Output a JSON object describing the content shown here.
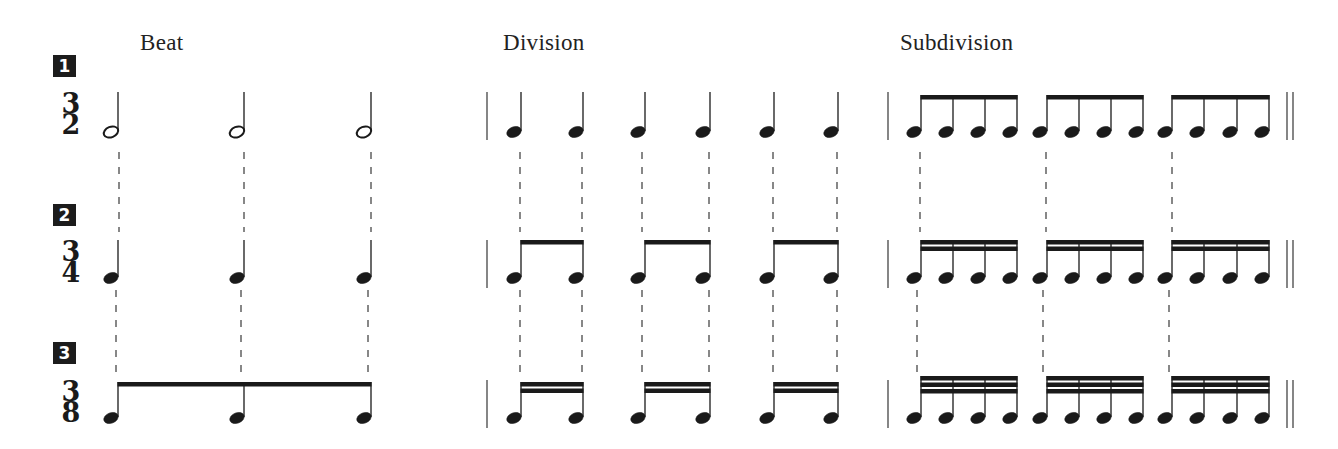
{
  "columns": [
    {
      "id": "beat",
      "title": "Beat",
      "x": 140
    },
    {
      "id": "division",
      "title": "Division",
      "x": 503
    },
    {
      "id": "subdivision",
      "title": "Subdivision",
      "x": 900
    }
  ],
  "rows": [
    {
      "number": "1",
      "time_signature": {
        "top": "3",
        "bottom": "2"
      },
      "badge_y": 54,
      "sig_y": 93,
      "beat": {
        "note": "half",
        "count": 3
      },
      "division": {
        "note": "quarter",
        "count": 6
      },
      "subdivision": {
        "note": "eighth",
        "groups": 3,
        "per_group": 4
      }
    },
    {
      "number": "2",
      "time_signature": {
        "top": "3",
        "bottom": "4"
      },
      "badge_y": 204,
      "sig_y": 240,
      "beat": {
        "note": "quarter",
        "count": 3
      },
      "division": {
        "note": "eighth",
        "groups": 3,
        "per_group": 2
      },
      "subdivision": {
        "note": "sixteenth",
        "groups": 3,
        "per_group": 4
      }
    },
    {
      "number": "3",
      "time_signature": {
        "top": "3",
        "bottom": "8"
      },
      "badge_y": 342,
      "sig_y": 380,
      "beat": {
        "note": "eighth",
        "count": 3,
        "beamed": true
      },
      "division": {
        "note": "sixteenth",
        "groups": 3,
        "per_group": 2
      },
      "subdivision": {
        "note": "thirty-second",
        "groups": 3,
        "per_group": 4
      }
    }
  ],
  "layout": {
    "beat_x": [
      118,
      244,
      371
    ],
    "division_x": [
      521,
      583,
      645,
      710,
      774,
      838
    ],
    "subdivision_x": [
      921,
      953,
      985,
      1017,
      1047,
      1079,
      1111,
      1143,
      1172,
      1204,
      1237,
      1269
    ],
    "row_note_y": [
      132,
      278,
      418
    ],
    "row_stem_top": [
      92,
      240,
      382
    ],
    "bar_left": [
      487,
      888
    ],
    "final_bar_x": [
      1287,
      1293
    ]
  },
  "colors": {
    "ink": "#1a1a1a",
    "dash": "#555555",
    "badge": "#1c1c1c"
  }
}
